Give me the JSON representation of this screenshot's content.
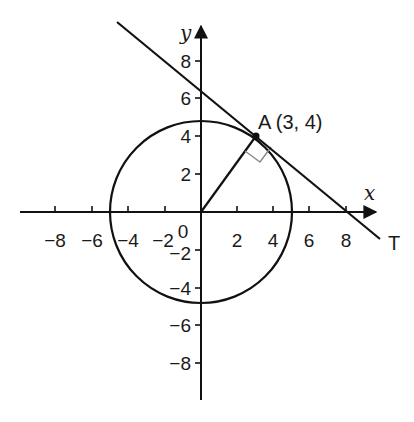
{
  "diagram": {
    "type": "coordinate-geometry",
    "axes": {
      "x_label": "x",
      "y_label": "y",
      "origin_label": "0",
      "x_ticks": [
        "−8",
        "−6",
        "−4",
        "−2",
        "2",
        "4",
        "6",
        "8"
      ],
      "y_ticks": [
        "8",
        "6",
        "4",
        "2",
        "−2",
        "−4",
        "−6",
        "−8"
      ]
    },
    "circle": {
      "center": [
        0,
        0
      ],
      "radius": 5
    },
    "point": {
      "name": "A",
      "label": "A (3, 4)",
      "x": 3,
      "y": 4
    },
    "tangent": {
      "label": "T",
      "equation": "3x + 4y = 25",
      "y_intercept": 6.25,
      "x_intercept": 8.33
    },
    "right_angle_marker": true
  },
  "colors": {
    "line": "#111111",
    "right_angle_marker": "#888888",
    "background": "#ffffff"
  }
}
